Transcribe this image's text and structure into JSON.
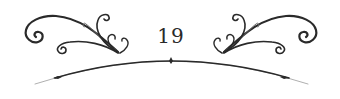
{
  "page": {
    "number": "19"
  },
  "colors": {
    "ink": "#2a2a2a",
    "ink_light": "#6a6a6a",
    "background": "#ffffff"
  },
  "ornament": {
    "style": "flourish-with-arc",
    "left_flourish": "scroll-flourish-left",
    "right_flourish": "scroll-flourish-right",
    "arc_markers": 3
  }
}
